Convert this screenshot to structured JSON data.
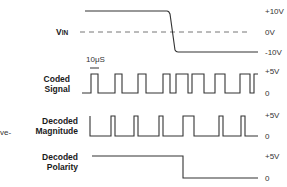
{
  "diagram": {
    "edge_fragment": "ve-",
    "time_marker": "10μS",
    "rows": [
      {
        "id": "vin",
        "label": "VIN",
        "label_sub": "IN",
        "levels": [
          "+10V",
          "0V",
          "-10V"
        ]
      },
      {
        "id": "coded-signal",
        "label_line1": "Coded",
        "label_line2": "Signal",
        "levels": [
          "+5V",
          "0"
        ]
      },
      {
        "id": "decoded-magnitude",
        "label_line1": "Decoded",
        "label_line2": "Magnitude",
        "levels": [
          "+5V",
          "0"
        ]
      },
      {
        "id": "decoded-polarity",
        "label_line1": "Decoded",
        "label_line2": "Polarity",
        "levels": [
          "+5V",
          "0"
        ]
      }
    ],
    "colors": {
      "trace": "#333333",
      "dashed": "#666666",
      "background": "#ffffff"
    }
  }
}
